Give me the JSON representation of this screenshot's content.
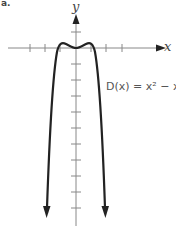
{
  "figure": {
    "item_label": "a.",
    "x_axis_label": "x",
    "y_axis_label": "y",
    "equation": "D(x) = x² − x⁴"
  },
  "colors": {
    "axis": "#888888",
    "curve": "#222222"
  }
}
